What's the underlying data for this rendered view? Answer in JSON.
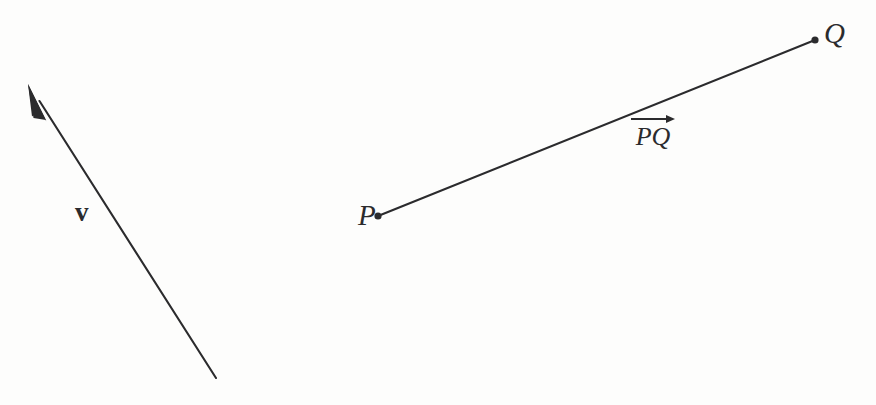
{
  "figure": {
    "background_color": "#fdfdfc",
    "ink_color": "#2b2b2d",
    "width": 876,
    "height": 405
  },
  "vector_arrow": {
    "name": "free-vector-v",
    "label": "v",
    "tail": {
      "x": 216,
      "y": 378
    },
    "tip": {
      "x": 28,
      "y": 84
    },
    "stroke_width": 2.1,
    "arrowhead": "filled-narrow-triangle",
    "label_position": {
      "x": 75,
      "y": 199
    }
  },
  "directed_segment": {
    "name": "directed-segment-PQ",
    "label": "PQ",
    "start_point": {
      "label": "P",
      "x": 378,
      "y": 216
    },
    "end_point": {
      "label": "Q",
      "x": 815,
      "y": 40
    },
    "stroke_width": 2.1,
    "endpoint_marker": "filled-dot",
    "endpoint_marker_radius": 3.6,
    "label_position": {
      "x": 631,
      "y": 114
    },
    "label_accent": "right-arrow-overline",
    "start_label_position": {
      "x": 358,
      "y": 201
    },
    "end_label_position": {
      "x": 824,
      "y": 19
    }
  }
}
